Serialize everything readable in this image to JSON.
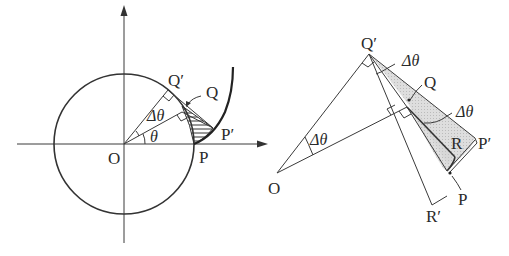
{
  "figure_left": {
    "title": "Involute of a circle with shaded element",
    "labels": {
      "origin": "O",
      "point_p": "P",
      "point_p_prime": "P′",
      "point_q": "Q",
      "point_q_prime": "Q′",
      "angle_theta": "θ",
      "angle_delta_theta": "Δθ"
    }
  },
  "figure_right": {
    "title": "Enlarged geometry of the shaded element",
    "labels": {
      "origin": "O",
      "point_q_prime": "Q′",
      "point_q": "Q",
      "point_p": "P",
      "point_p_prime": "P′",
      "point_r": "R",
      "point_r_prime": "R′",
      "angle_delta_theta_1": "Δθ",
      "angle_delta_theta_2": "Δθ",
      "angle_delta_theta_3": "Δθ"
    }
  },
  "colors": {
    "line": "#333333",
    "shade": "#d8d8d8",
    "background": "#ffffff"
  }
}
